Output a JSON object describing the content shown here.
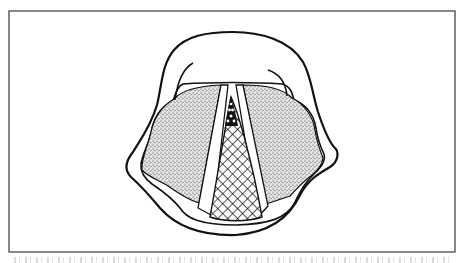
{
  "figure": {
    "type": "line-drawing",
    "frame": {
      "x": 9,
      "y": 11,
      "width": 446,
      "height": 241,
      "stroke": "#2b2b2b"
    },
    "regions": [
      {
        "name": "outer-outline",
        "fill": "#ffffff",
        "stroke": "#111111"
      },
      {
        "name": "left-stippled-region",
        "fill": "stipple"
      },
      {
        "name": "right-stippled-region",
        "fill": "stipple"
      },
      {
        "name": "left-white-band",
        "fill": "#ffffff"
      },
      {
        "name": "right-white-band",
        "fill": "#ffffff"
      },
      {
        "name": "central-crosshatched-triangle",
        "fill": "crosshatch"
      },
      {
        "name": "dark-apex-with-dots",
        "fill": "#111111"
      }
    ]
  },
  "caption": {
    "visible": "partially cropped",
    "text": ""
  },
  "colors": {
    "background": "#ffffff",
    "ink": "#111111",
    "frame": "#3a3a3a",
    "stipple_base": "#c9c9c9"
  }
}
